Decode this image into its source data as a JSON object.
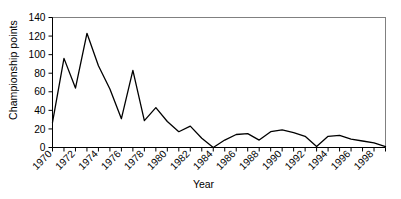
{
  "chart_data": {
    "type": "line",
    "title": "",
    "xlabel": "Year",
    "ylabel": "Championship points",
    "xlim": [
      1970,
      1999
    ],
    "ylim": [
      0,
      140
    ],
    "ytick_step": 20,
    "yticks": [
      0,
      20,
      40,
      60,
      80,
      100,
      120,
      140
    ],
    "xticks_labeled": [
      1970,
      1972,
      1974,
      1976,
      1978,
      1980,
      1982,
      1984,
      1986,
      1988,
      1990,
      1992,
      1994,
      1996,
      1998
    ],
    "xtick_step": 1,
    "xtick_label_step": 2,
    "xtick_label_rotation": -45,
    "grid": false,
    "legend": false,
    "line_color": "#000000",
    "frame_color": "#808080",
    "x": [
      1970,
      1971,
      1972,
      1973,
      1974,
      1975,
      1976,
      1977,
      1978,
      1979,
      1980,
      1981,
      1982,
      1983,
      1984,
      1985,
      1986,
      1987,
      1988,
      1989,
      1990,
      1991,
      1992,
      1993,
      1994,
      1995,
      1996,
      1997,
      1998,
      1999
    ],
    "values": [
      27,
      96,
      64,
      123,
      88,
      63,
      31,
      83,
      29,
      43,
      28,
      17,
      23,
      10,
      0,
      8,
      14,
      15,
      8,
      17,
      19,
      16,
      12,
      1,
      12,
      13,
      9,
      7,
      5,
      1
    ],
    "series": [
      {
        "name": "Championship points",
        "values": [
          27,
          96,
          64,
          123,
          88,
          63,
          31,
          83,
          29,
          43,
          28,
          17,
          23,
          10,
          0,
          8,
          14,
          15,
          8,
          17,
          19,
          16,
          12,
          1,
          12,
          13,
          9,
          7,
          5,
          1
        ]
      }
    ]
  },
  "axis": {
    "y_title": "Championship points",
    "x_title": "Year"
  }
}
